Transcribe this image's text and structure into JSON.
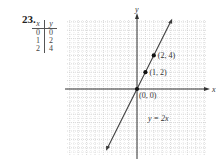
{
  "problem_number": "23.",
  "table": {
    "headers": [
      "x",
      "y"
    ],
    "rows": [
      [
        "0",
        "0"
      ],
      [
        "1",
        "2"
      ],
      [
        "2",
        "4"
      ]
    ]
  },
  "chart_data": {
    "type": "line",
    "title": "",
    "equation_label": "y = 2x",
    "xlabel": "x",
    "ylabel": "y",
    "xlim": [
      -8,
      8
    ],
    "ylim": [
      -8,
      8
    ],
    "grid": true,
    "line": {
      "slope": 2,
      "intercept": 0,
      "x_range": [
        -3.5,
        4
      ]
    },
    "points": [
      {
        "x": 0,
        "y": 0,
        "label": "(0, 0)"
      },
      {
        "x": 1,
        "y": 2,
        "label": "(1, 2)"
      },
      {
        "x": 2,
        "y": 4,
        "label": "(2, 4)"
      }
    ]
  },
  "colors": {
    "line": "#3a3a3a",
    "grid": "#c8c8c8",
    "axis": "#333333"
  }
}
